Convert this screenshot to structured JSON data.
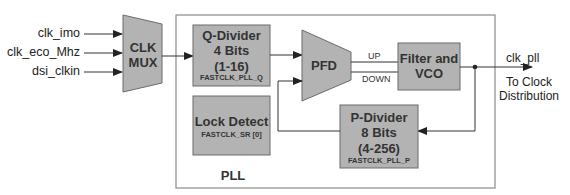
{
  "inputs": [
    {
      "label": "clk_imo"
    },
    {
      "label": "clk_eco_Mhz"
    },
    {
      "label": "dsi_clkin"
    }
  ],
  "mux": {
    "line1": "CLK",
    "line2": "MUX"
  },
  "pll": {
    "label": "PLL"
  },
  "q_divider": {
    "title": "Q-Divider",
    "bits": "4 Bits",
    "range": "(1-16)",
    "register": "FASTCLK_PLL_Q"
  },
  "lock_detect": {
    "title": "Lock Detect",
    "register": "FASTCLK_SR [0]"
  },
  "pfd": {
    "label": "PFD"
  },
  "signals": {
    "up": "UP",
    "down": "DOWN"
  },
  "filter_vco": {
    "line1": "Filter and",
    "line2": "VCO"
  },
  "p_divider": {
    "title": "P-Divider",
    "bits": "8 Bits",
    "range": "(4-256)",
    "register": "FASTCLK_PLL_P"
  },
  "output": {
    "label": "clk_pll",
    "dest_line1": "To Clock",
    "dest_line2": "Distribution"
  },
  "colors": {
    "block_fill": "#b3b3b3",
    "block_stroke": "#6b6b6b",
    "line": "#333333",
    "pll_border": "#8a8a8a"
  }
}
